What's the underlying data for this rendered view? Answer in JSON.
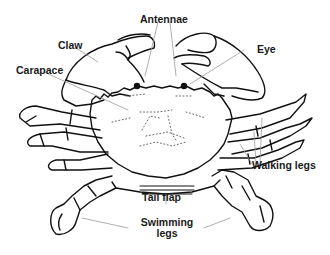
{
  "diagram": {
    "colors": {
      "line": "#111111",
      "leader": "#9a9a9a",
      "background": "#ffffff"
    },
    "labels": {
      "antennae": "Antennae",
      "claw": "Claw",
      "eye": "Eye",
      "carapace": "Carapace",
      "walking_legs": "Walking legs",
      "tail_flap": "Tail flap",
      "swimming_legs_line1": "Swimming",
      "swimming_legs_line2": "legs"
    }
  }
}
